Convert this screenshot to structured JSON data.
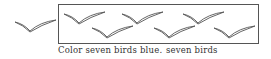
{
  "worksheet": {
    "instruction": "Color seven birds blue.",
    "answer_label": "seven birds",
    "line_color": "#555555",
    "birds_outside": [
      {
        "x": 14,
        "y": 18
      }
    ],
    "birds_in_box": [
      {
        "x": 63,
        "y": 10
      },
      {
        "x": 121,
        "y": 10
      },
      {
        "x": 182,
        "y": 10
      },
      {
        "x": 91,
        "y": 24
      },
      {
        "x": 153,
        "y": 24
      },
      {
        "x": 213,
        "y": 24
      }
    ],
    "bird_count_total": 7
  }
}
